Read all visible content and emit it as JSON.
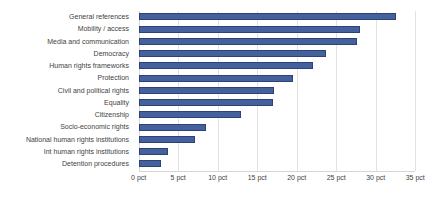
{
  "chart_data": {
    "type": "bar",
    "orientation": "horizontal",
    "title": "",
    "subtitle": "",
    "xlabel": "",
    "ylabel": "",
    "categories": [
      "General references",
      "Mobility / access",
      "Media and communication",
      "Democracy",
      "Human rights frameworks",
      "Protection",
      "Civil and political rights",
      "Equality",
      "Citizenship",
      "Socio-economic rights",
      "National human rights institutions",
      "Int human rights institutions",
      "Detention procedures"
    ],
    "values": [
      32.6,
      28.0,
      27.6,
      23.7,
      22.1,
      19.5,
      17.1,
      17.0,
      13.0,
      8.5,
      7.1,
      3.7,
      2.8
    ],
    "value_unit": "pct",
    "xlim": [
      0,
      35
    ],
    "xticks": [
      0,
      5,
      10,
      15,
      20,
      25,
      30,
      35
    ],
    "xtick_labels": [
      "0 pct",
      "5 pct",
      "10 pct",
      "15 pct",
      "20 pct",
      "25 pct",
      "30 pct",
      "35 pct"
    ],
    "grid": "vertical",
    "legend": "none",
    "series": [
      {
        "name": "",
        "values": [
          32.6,
          28.0,
          27.6,
          23.7,
          22.1,
          19.5,
          17.1,
          17.0,
          13.0,
          8.5,
          7.1,
          3.7,
          2.8
        ]
      }
    ],
    "colors": {
      "bar_fill": "#44619d",
      "bar_border": "#2c4373",
      "gridline": "#e3e3e3",
      "axis_line": "#d6d6d6",
      "label_text": "#3f3f3f",
      "background": "#ffffff"
    }
  }
}
